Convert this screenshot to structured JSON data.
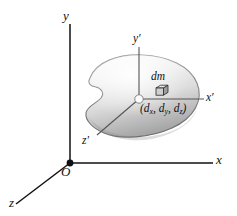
{
  "figure": {
    "background_color": "#ffffff",
    "ink_color": "#111111",
    "body_fill_light": "#f2f2f2",
    "body_fill_mid": "#d8d8d8",
    "body_fill_dark": "#a8a8a8",
    "body_outline_color": "#6e6e6e"
  },
  "axes": {
    "fixed": {
      "origin_label": "O",
      "x_label": "x",
      "y_label": "y",
      "z_label": "z"
    },
    "primed": {
      "x_label": "x",
      "x_prime_mark": "′",
      "y_label": "y",
      "y_prime_mark": "′",
      "z_label": "z",
      "z_prime_mark": "′"
    }
  },
  "annotations": {
    "mass_element_label": "dm",
    "mass_element_icon": "cube-icon",
    "position_label_open": "(",
    "position_d": "d",
    "position_sub_x": "x",
    "position_comma1": ", ",
    "position_sub_y": "y",
    "position_comma2": ", ",
    "position_sub_z": "z",
    "position_label_close": ")",
    "position_label_full": "(dₓ, dᵧ, d₂)"
  }
}
